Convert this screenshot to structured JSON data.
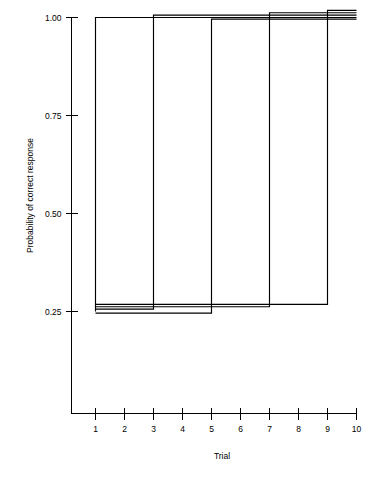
{
  "chart_data": {
    "type": "line",
    "title": "",
    "xlabel": "Trial",
    "ylabel": "Probability of correct response",
    "xlim": [
      0.6,
      10.4
    ],
    "ylim": [
      0.0,
      1.0
    ],
    "grid": false,
    "legend": "none",
    "x_ticks": [
      1,
      2,
      3,
      4,
      5,
      6,
      7,
      8,
      9,
      10
    ],
    "x_tick_labels": [
      "1",
      "2",
      "3",
      "4",
      "5",
      "6",
      "7",
      "8",
      "9",
      "10"
    ],
    "y_ticks": [
      0.25,
      0.5,
      0.75,
      1.0
    ],
    "y_tick_labels": [
      "0.25",
      "0.50",
      "0.75",
      "1.00"
    ],
    "x": [
      1,
      2,
      3,
      4,
      5,
      6,
      7,
      8,
      9,
      10
    ],
    "series": [
      {
        "name": "Curve 1",
        "jump_trial": 1,
        "pre_level": 0.25,
        "post_level": 1.0,
        "offset": 0.0,
        "values": [
          1.0,
          1.0,
          1.0,
          1.0,
          1.0,
          1.0,
          1.0,
          1.0,
          1.0,
          1.0
        ]
      },
      {
        "name": "Curve 2",
        "jump_trial": 3,
        "pre_level": 0.25,
        "post_level": 1.0,
        "offset": -0.006,
        "values": [
          0.25,
          0.25,
          1.0,
          1.0,
          1.0,
          1.0,
          1.0,
          1.0,
          1.0,
          1.0
        ]
      },
      {
        "name": "Curve 3",
        "jump_trial": 5,
        "pre_level": 0.25,
        "post_level": 1.0,
        "offset": 0.004,
        "values": [
          0.25,
          0.25,
          0.25,
          0.25,
          1.0,
          1.0,
          1.0,
          1.0,
          1.0,
          1.0
        ]
      },
      {
        "name": "Curve 4",
        "jump_trial": 7,
        "pre_level": 0.25,
        "post_level": 1.0,
        "offset": -0.012,
        "values": [
          0.25,
          0.25,
          0.25,
          0.25,
          0.25,
          0.25,
          1.0,
          1.0,
          1.0,
          1.0
        ]
      },
      {
        "name": "Curve 5",
        "jump_trial": 9,
        "pre_level": 0.25,
        "post_level": 1.0,
        "offset": -0.018,
        "values": [
          0.25,
          0.25,
          0.25,
          0.25,
          0.25,
          0.25,
          0.25,
          0.25,
          1.0,
          1.0
        ]
      }
    ],
    "colors": {
      "line": "#000000",
      "axis": "#000000",
      "background": "#ffffff"
    }
  }
}
